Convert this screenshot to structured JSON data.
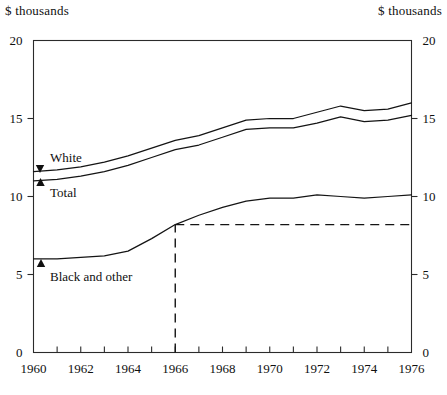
{
  "header": {
    "left_axis_unit": "$ thousands",
    "right_axis_unit": "$ thousands"
  },
  "chart_data": {
    "type": "line",
    "title": "",
    "subtitle": "",
    "xlabel": "",
    "ylabel": "$ thousands",
    "y2label": "$ thousands",
    "xlim": [
      1960,
      1976
    ],
    "ylim": [
      0,
      20
    ],
    "grid": false,
    "legend_position": "inline-annotations",
    "x_tick_labels": [
      "1960",
      "1962",
      "1964",
      "1966",
      "1968",
      "1970",
      "1972",
      "1974",
      "1976"
    ],
    "x_tick_values": [
      1960,
      1962,
      1964,
      1966,
      1968,
      1970,
      1972,
      1974,
      1976
    ],
    "x_minor_tick_values": [
      1961,
      1963,
      1965,
      1967,
      1969,
      1971,
      1973,
      1975
    ],
    "y_tick_labels": [
      "0",
      "5",
      "10",
      "15",
      "20"
    ],
    "y_tick_values": [
      0,
      5,
      10,
      15,
      20
    ],
    "y2_tick_labels": [
      "0",
      "5",
      "10",
      "15",
      "20"
    ],
    "x": [
      1960,
      1961,
      1962,
      1963,
      1964,
      1965,
      1966,
      1967,
      1968,
      1969,
      1970,
      1971,
      1972,
      1973,
      1974,
      1975,
      1976
    ],
    "series": [
      {
        "name": "White",
        "label": "White",
        "marker": "down-arrow",
        "values": [
          11.6,
          11.7,
          11.9,
          12.2,
          12.6,
          13.1,
          13.6,
          13.9,
          14.4,
          14.9,
          15.0,
          15.0,
          15.4,
          15.8,
          15.5,
          15.6,
          16.0
        ]
      },
      {
        "name": "Total",
        "label": "Total",
        "marker": "up-arrow",
        "values": [
          11.0,
          11.1,
          11.3,
          11.6,
          12.0,
          12.5,
          13.0,
          13.3,
          13.8,
          14.3,
          14.4,
          14.4,
          14.7,
          15.1,
          14.8,
          14.9,
          15.2
        ]
      },
      {
        "name": "Black and other",
        "label": "Black and other",
        "marker": "up-arrow",
        "values": [
          6.0,
          6.0,
          6.1,
          6.2,
          6.5,
          7.3,
          8.2,
          8.8,
          9.3,
          9.7,
          9.9,
          9.9,
          10.1,
          10.0,
          9.9,
          10.0,
          10.1
        ]
      }
    ],
    "annotations": [
      {
        "name": "reference-line-vertical",
        "type": "dashed-vertical",
        "x": 1966,
        "y_from": 0,
        "y_to": 8.2
      },
      {
        "name": "reference-line-horizontal",
        "type": "dashed-horizontal",
        "y": 8.2,
        "x_from": 1966,
        "x_to": 1976
      }
    ]
  }
}
